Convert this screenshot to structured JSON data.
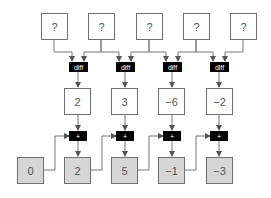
{
  "diagram": {
    "inputs": [
      "?",
      "?",
      "?",
      "?",
      "?"
    ],
    "diff_ops": [
      "diff",
      "diff",
      "diff",
      "diff"
    ],
    "differences": [
      "2",
      "3",
      "−6",
      "−2"
    ],
    "add_ops": [
      "+",
      "+",
      "+",
      "+"
    ],
    "cumulative": [
      "0",
      "2",
      "5",
      "−1",
      "−3"
    ],
    "colors": {
      "box_border": "#6f6f6f",
      "cumulative_fill": "#d6d6d6",
      "op_fill": "#000000",
      "arrow": "#555555"
    }
  }
}
